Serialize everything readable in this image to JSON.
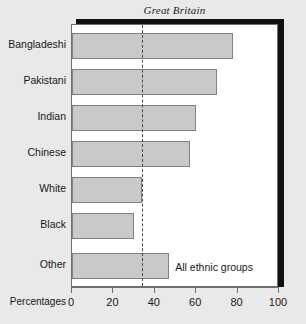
{
  "chart_data": {
    "type": "bar",
    "orientation": "horizontal",
    "title": "Great Britain",
    "xlabel": "Percentages",
    "ylabel": "",
    "categories": [
      "Bangladeshi",
      "Pakistani",
      "Indian",
      "Chinese",
      "White",
      "Black",
      "Other"
    ],
    "values": [
      78,
      70,
      60,
      57,
      34,
      30,
      47
    ],
    "xlim": [
      0,
      100
    ],
    "xticks": [
      0,
      20,
      40,
      60,
      80,
      100
    ],
    "xtick_labels": [
      "0",
      "20",
      "40",
      "60",
      "80",
      "100"
    ],
    "grid": false,
    "legend": "none",
    "annotations": [
      {
        "name": "all-ethnic-groups-reference",
        "label": "All ethnic groups",
        "value": 34,
        "style": "vertical dashed line"
      }
    ],
    "colors": {
      "bar_fill": "#c9c9c9",
      "bar_border": "#818181",
      "plot_background": "#ffffff",
      "figure_background": "#e9e9e9",
      "frame": "#6f6f6f",
      "shadow": "#101010",
      "text": "#181818"
    }
  }
}
